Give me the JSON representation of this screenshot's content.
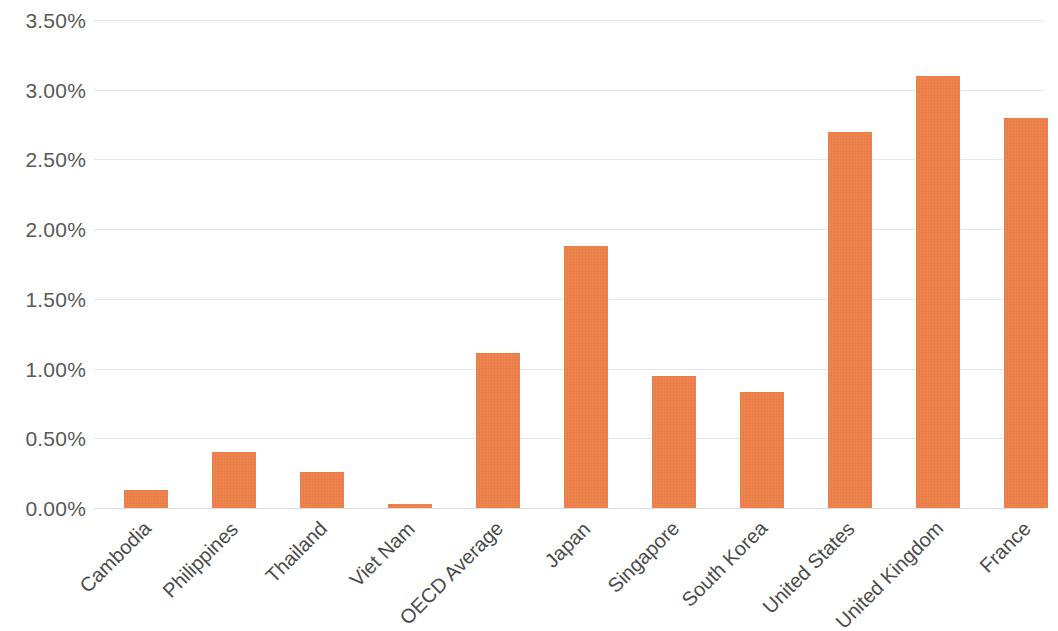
{
  "chart_data": {
    "type": "bar",
    "title": "",
    "subtitle": "",
    "xlabel": "",
    "ylabel": "",
    "categories": [
      "Cambodia",
      "Philippines",
      "Thailand",
      "Viet Nam",
      "OECD Average",
      "Japan",
      "Singapore",
      "South Korea",
      "United States",
      "United Kingdom",
      "France"
    ],
    "values": [
      0.13,
      0.4,
      0.26,
      0.03,
      1.11,
      1.88,
      0.95,
      0.83,
      2.7,
      3.1,
      2.8
    ],
    "value_format": "percent",
    "ylim": [
      0,
      3.5
    ],
    "ytick_values": [
      0.0,
      0.5,
      1.0,
      1.5,
      2.0,
      2.5,
      3.0,
      3.5
    ],
    "ytick_labels": [
      "0.00%",
      "0.50%",
      "1.00%",
      "1.50%",
      "2.00%",
      "2.50%",
      "3.00%",
      "3.50%"
    ],
    "grid": true,
    "grid_axis": "y",
    "legend": false,
    "legend_position": "none",
    "bar_color": "#ee8049",
    "gridline_color": "#e8e8e8",
    "tick_label_color": "#595959",
    "category_label_color": "#4a4a4a",
    "background_color": "#ffffff",
    "xtick_rotation_degrees": -45,
    "series": [
      {
        "name": "",
        "values": [
          0.13,
          0.4,
          0.26,
          0.03,
          1.11,
          1.88,
          0.95,
          0.83,
          2.7,
          3.1,
          2.8
        ]
      }
    ]
  }
}
